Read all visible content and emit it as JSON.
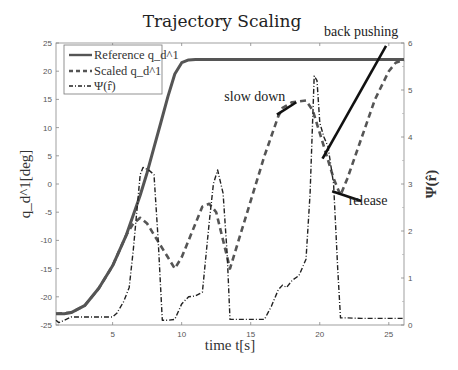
{
  "chart_data": {
    "type": "line",
    "title": "Trajectory Scaling",
    "xlabel": "time t[s]",
    "ylabel": "q_d^1[deg]",
    "ylabel_right": "Ψ(r̂)",
    "xlim": [
      0.9,
      26.1
    ],
    "ylim": [
      -25,
      25
    ],
    "ylim_right": [
      0,
      6
    ],
    "xticks": [
      5,
      10,
      15,
      20,
      25
    ],
    "yticks": [
      -25,
      -20,
      -15,
      -10,
      -5,
      0,
      5,
      10,
      15,
      20,
      25
    ],
    "yticks_right": [
      0,
      1,
      2,
      3,
      4,
      5,
      6
    ],
    "grid": false,
    "legend": {
      "position": "upper left",
      "entries": [
        "Reference q_d^1",
        "Scaled q_d^1",
        "Ψ(r̂)"
      ]
    },
    "series": [
      {
        "name": "Reference q_d^1",
        "axis": "left",
        "style": "solid",
        "color": "#555555",
        "x": [
          0.9,
          1.5,
          2.0,
          3.0,
          4.0,
          5.0,
          6.0,
          7.0,
          7.5,
          8.0,
          8.5,
          9.0,
          9.5,
          10.0,
          10.5,
          11.0,
          12.0,
          26.1
        ],
        "y": [
          -23,
          -23,
          -22.8,
          -21.5,
          -18.5,
          -14.5,
          -9,
          -2,
          2,
          6.5,
          11,
          15.5,
          19.5,
          21.5,
          22,
          22.1,
          22.1,
          22.1
        ]
      },
      {
        "name": "Scaled q_d^1",
        "axis": "left",
        "style": "dashed",
        "color": "#555555",
        "x": [
          0.9,
          2.0,
          3.0,
          4.0,
          5.0,
          6.0,
          6.5,
          7.0,
          7.5,
          8.0,
          9.0,
          9.5,
          10.0,
          11.0,
          11.5,
          12.0,
          12.5,
          13.0,
          13.5,
          14.0,
          15.0,
          16.0,
          17.0,
          17.3,
          18.0,
          19.0,
          19.5,
          20.0,
          20.5,
          21.0,
          21.5,
          22.0,
          23.0,
          24.0,
          25.0,
          25.5,
          26.1
        ],
        "y": [
          -23,
          -22.8,
          -21.5,
          -18.5,
          -14.5,
          -9,
          -7,
          -6,
          -7,
          -9,
          -13,
          -15,
          -13,
          -7,
          -4,
          -3.5,
          -5,
          -10,
          -15,
          -11,
          -3,
          5,
          12,
          13.5,
          14.5,
          14.8,
          13,
          9,
          5,
          1,
          -2,
          1,
          8,
          15,
          20,
          21.5,
          22
        ]
      },
      {
        "name": "Ψ(r̂)",
        "axis": "right",
        "style": "dash-dot",
        "color": "#222222",
        "x": [
          0.9,
          1.1,
          1.5,
          2.0,
          3.0,
          4.0,
          5.0,
          5.3,
          5.8,
          6.2,
          6.5,
          7.0,
          7.2,
          7.6,
          8.0,
          8.3,
          8.6,
          9.0,
          9.5,
          10.0,
          10.5,
          11.0,
          11.5,
          12.0,
          12.3,
          12.6,
          13.0,
          13.3,
          13.5,
          14.0,
          15.0,
          16.0,
          16.5,
          17.0,
          17.3,
          17.6,
          18.0,
          18.5,
          19.0,
          19.3,
          19.6,
          19.8,
          20.0,
          20.3,
          20.6,
          21.0,
          21.3,
          21.5,
          22.0,
          23.0,
          24.0,
          25.0,
          26.1
        ],
        "y": [
          0.1,
          0.05,
          0.1,
          0.17,
          0.17,
          0.17,
          0.17,
          0.25,
          0.5,
          0.8,
          1.6,
          3.2,
          3.35,
          3.3,
          3.2,
          1.8,
          0.1,
          0.1,
          0.12,
          0.45,
          0.6,
          0.62,
          0.7,
          2.2,
          3.0,
          3.3,
          2.8,
          1.5,
          0.12,
          0.12,
          0.12,
          0.12,
          0.4,
          0.75,
          0.85,
          0.8,
          0.95,
          1.05,
          1.4,
          2.8,
          5.3,
          5.2,
          4.3,
          4.0,
          3.8,
          3.0,
          1.2,
          0.15,
          0.15,
          0.14,
          0.14,
          0.14,
          0.14
        ]
      }
    ],
    "annotations": [
      {
        "text": "slow down",
        "label_xy": [
          15.3,
          14.8
        ],
        "arrow_to": [
          18.3,
          14.5
        ]
      },
      {
        "text": "back pushing",
        "label_xy": [
          23.0,
          26.2
        ],
        "arrow_from": [
          24.8,
          24.5
        ],
        "arrow_to": [
          20.2,
          4.5
        ]
      },
      {
        "text": "release",
        "label_xy": [
          23.5,
          -3.8
        ],
        "arrow_from": [
          23.0,
          -3.0
        ],
        "arrow_to": [
          20.9,
          -1.3
        ]
      }
    ]
  }
}
